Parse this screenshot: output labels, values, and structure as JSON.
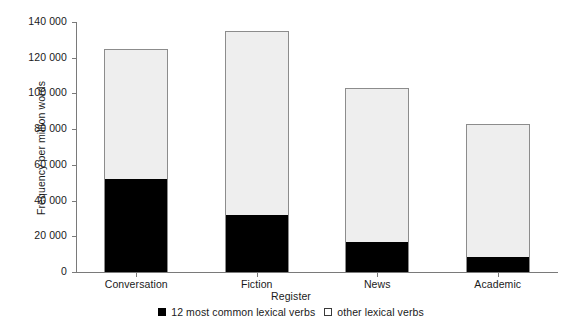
{
  "chart_data": {
    "type": "bar",
    "subtype": "stacked-vertical",
    "title": "",
    "xlabel": "Register",
    "ylabel": "Frequency per million words",
    "categories": [
      "Conversation",
      "Fiction",
      "News",
      "Academic"
    ],
    "series": [
      {
        "name": "12 most common lexical verbs",
        "color": "#000000",
        "values": [
          52000,
          32000,
          17000,
          8500
        ]
      },
      {
        "name": "other lexical verbs",
        "color": "#eeeeee",
        "values": [
          73000,
          103000,
          86000,
          74500
        ]
      }
    ],
    "totals": [
      125000,
      135000,
      103000,
      83000
    ],
    "ylim": [
      0,
      140000
    ],
    "ytick_values": [
      0,
      20000,
      40000,
      60000,
      80000,
      100000,
      120000,
      140000
    ],
    "ytick_labels": [
      "0",
      "20 000",
      "40 000",
      "60 000",
      "80 000",
      "100 000",
      "120 000",
      "140 000"
    ],
    "grid": false,
    "legend_position": "bottom-center"
  },
  "axes": {
    "y_title": "Frequency per million words",
    "x_title": "Register"
  },
  "legend": {
    "items": [
      {
        "label": "12 most common lexical verbs",
        "swatch": "black-square-icon"
      },
      {
        "label": "other lexical verbs",
        "swatch": "white-square-icon"
      }
    ]
  }
}
